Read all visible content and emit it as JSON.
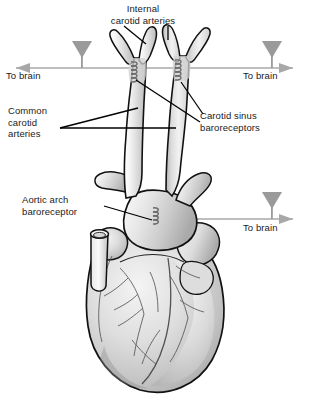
{
  "figure": {
    "background_color": "#ffffff",
    "width": 309,
    "height": 399
  },
  "labels": {
    "internal_carotid": "Internal\ncarotid arteries",
    "internal_carotid_line1": "Internal",
    "internal_carotid_line2": "carotid arteries",
    "common_carotid_line1": "Common",
    "common_carotid_line2": "carotid",
    "common_carotid_line3": "arteries",
    "carotid_sinus_line1": "Carotid sinus",
    "carotid_sinus_line2": "baroreceptors",
    "aortic_arch_line1": "Aortic arch",
    "aortic_arch_line2": "baroreceptor",
    "to_brain_left": "To brain",
    "to_brain_right": "To brain",
    "to_brain_aorta": "To brain"
  },
  "colors": {
    "outline": "#111111",
    "vessel_fill_light": "#f2f2f2",
    "vessel_fill_mid": "#d9d9d9",
    "heart_fill_light": "#efefef",
    "heart_fill_mid": "#cfcfcf",
    "heart_fill_dark": "#9e9e9e",
    "leader_line": "#000000",
    "nerve_arrow": "#9a9a9a",
    "text": "#1a1a1a"
  },
  "nerve_pathways": [
    {
      "name": "left-carotid-to-brain",
      "direction": "left",
      "label": "To brain",
      "axis_y": 68,
      "marker_x": 82
    },
    {
      "name": "right-carotid-to-brain",
      "direction": "right",
      "label": "To brain",
      "axis_y": 68,
      "marker_x": 272
    },
    {
      "name": "aortic-to-brain",
      "direction": "right",
      "label": "To brain",
      "axis_y": 219,
      "marker_x": 272
    }
  ],
  "structures": [
    {
      "name": "internal-carotid-arteries",
      "count": 2
    },
    {
      "name": "external-carotid-arteries",
      "count": 2
    },
    {
      "name": "common-carotid-arteries",
      "count": 2
    },
    {
      "name": "carotid-sinus-baroreceptors",
      "count": 2
    },
    {
      "name": "aortic-arch-baroreceptor",
      "count": 1
    },
    {
      "name": "aortic-arch",
      "count": 1
    },
    {
      "name": "superior-vena-cava-stump",
      "count": 1
    },
    {
      "name": "heart",
      "count": 1
    }
  ]
}
